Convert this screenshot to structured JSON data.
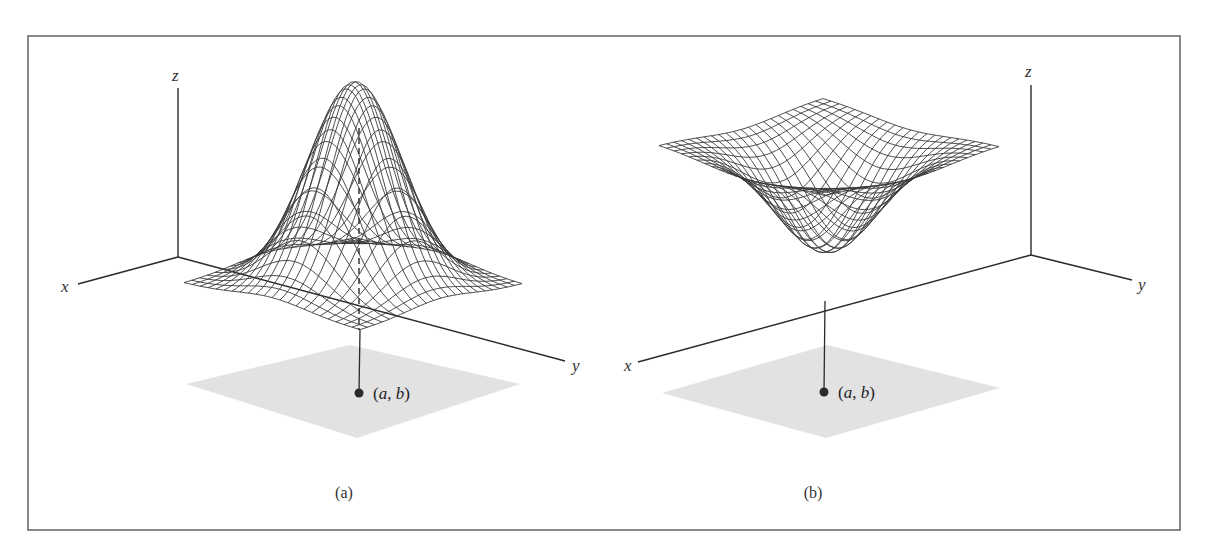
{
  "figure": {
    "frame": {
      "x": 28,
      "y": 36,
      "width": 1152,
      "height": 494,
      "stroke": "#6b6b6b"
    },
    "shadow_color": "#e2e2e2",
    "line_color": "#2a2a2a",
    "panels": [
      {
        "id": "a",
        "caption": "(a)",
        "caption_pos": [
          344,
          498
        ],
        "surface_type": "local maximum (peak)",
        "axes": {
          "origin": [
            178,
            257
          ],
          "z_end": [
            178,
            88
          ],
          "x_end": [
            78,
            284
          ],
          "y_end": [
            565,
            361
          ],
          "z_label": "z",
          "z_label_pos": [
            172,
            81
          ],
          "x_label": "x",
          "x_label_pos": [
            61,
            292
          ],
          "y_label": "y",
          "y_label_pos": [
            572,
            371
          ]
        },
        "mesh": {
          "corner_left": [
            184,
            283
          ],
          "corner_back": [
            355,
            238
          ],
          "corner_right": [
            522,
            284
          ],
          "corner_front": [
            360,
            330
          ],
          "extremum_height": -202,
          "grid_lines": 23,
          "sigma": 0.2
        },
        "shadow": [
          [
            186,
            384
          ],
          [
            350,
            345
          ],
          [
            520,
            384
          ],
          [
            357,
            438
          ]
        ],
        "point": {
          "pos": [
            359,
            393
          ],
          "label": "(a, b)",
          "label_pos": [
            373,
            399
          ]
        },
        "drop_line": [
          [
            360,
            330
          ],
          [
            359,
            393
          ]
        ],
        "peak_dashed_line": [
          [
            359,
            128
          ],
          [
            359,
            330
          ]
        ]
      },
      {
        "id": "b",
        "caption": "(b)",
        "caption_pos": [
          813,
          498
        ],
        "surface_type": "local minimum (well)",
        "axes": {
          "origin": [
            1031,
            255
          ],
          "z_end": [
            1031,
            85
          ],
          "x_end": [
            638,
            362
          ],
          "y_end": [
            1132,
            280
          ],
          "z_label": "z",
          "z_label_pos": [
            1025,
            77
          ],
          "x_label": "x",
          "x_label_pos": [
            624,
            371
          ],
          "y_label": "y",
          "y_label_pos": [
            1138,
            290
          ]
        },
        "mesh": {
          "corner_left": [
            659,
            145
          ],
          "corner_back": [
            823,
            98
          ],
          "corner_right": [
            999,
            146
          ],
          "corner_front": [
            825,
            195
          ],
          "extremum_height": 106,
          "grid_lines": 23,
          "sigma": 0.22
        },
        "shadow": [
          [
            662,
            393
          ],
          [
            827,
            345
          ],
          [
            1000,
            388
          ],
          [
            826,
            438
          ]
        ],
        "point": {
          "pos": [
            824,
            392
          ],
          "label": "(a, b)",
          "label_pos": [
            838,
            398
          ]
        },
        "drop_line": [
          [
            825,
            301
          ],
          [
            824,
            392
          ]
        ]
      }
    ]
  }
}
